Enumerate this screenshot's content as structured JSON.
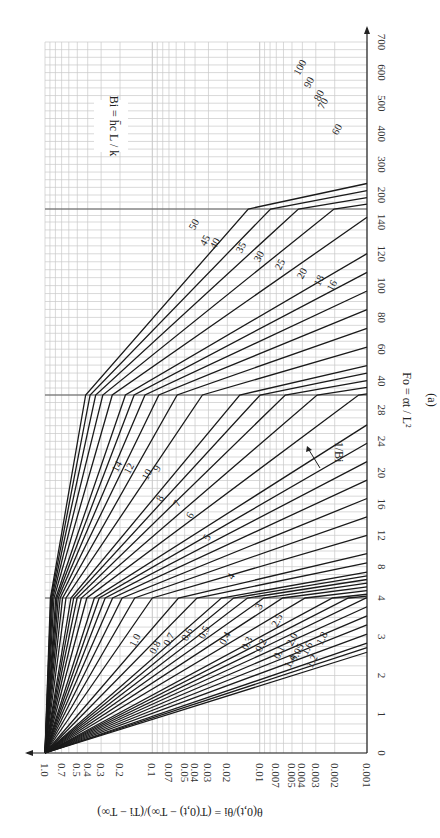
{
  "chart_data": {
    "type": "line",
    "panel_label": "(a)",
    "orientation": "rotated 90° counter-clockwise",
    "xlabel": "Fo = αt / L²",
    "ylabel": "θ(0,t)/θi = (T(0,t) − T∞)/(Ti − T∞)",
    "parameter_label": "Bi = h̄c L / k",
    "curve_family_label": "1/Bi",
    "x_axis": {
      "name": "Fo",
      "segments": [
        {
          "range": [
            0,
            4
          ],
          "ticks": [
            0,
            1,
            2,
            3,
            4
          ]
        },
        {
          "range": [
            4,
            30
          ],
          "ticks": [
            4,
            8,
            12,
            16,
            20,
            24,
            28
          ]
        },
        {
          "range": [
            30,
            150
          ],
          "ticks": [
            40,
            60,
            80,
            100,
            120,
            140
          ]
        },
        {
          "range": [
            150,
            700
          ],
          "ticks": [
            200,
            300,
            400,
            500,
            600,
            700
          ]
        }
      ],
      "tick_labels": [
        "0",
        "1",
        "2",
        "3",
        "4",
        "8",
        "12",
        "16",
        "20",
        "24",
        "28",
        "40",
        "60",
        "80",
        "100",
        "120",
        "140",
        "200",
        "300",
        "400",
        "500",
        "600",
        "700"
      ]
    },
    "y_axis": {
      "name": "theta_ratio",
      "scale": "log",
      "range": [
        0.001,
        1.0
      ],
      "tick_labels": [
        "1.0",
        "0.7",
        "0.5",
        "0.4",
        "0.3",
        "0.2",
        "0.1",
        "0.07",
        "0.05",
        "0.04",
        "0.03",
        "0.02",
        "0.01",
        "0.007",
        "0.005",
        "0.004",
        "0.003",
        "0.002",
        "0.001"
      ]
    },
    "grid": true,
    "series_inv_bi": [
      "0",
      "0.05",
      "0.1",
      "0.2",
      "0.3",
      "0.4",
      "0.5",
      "0.6",
      "0.7",
      "0.8",
      "1.0",
      "1.2",
      "1.4",
      "1.6",
      "1.8",
      "2.0",
      "2.5",
      "3",
      "4",
      "5",
      "6",
      "7",
      "8",
      "9",
      "10",
      "12",
      "14",
      "16",
      "18",
      "20",
      "25",
      "30",
      "35",
      "40",
      "45",
      "50",
      "60",
      "70",
      "80",
      "90",
      "100"
    ]
  }
}
